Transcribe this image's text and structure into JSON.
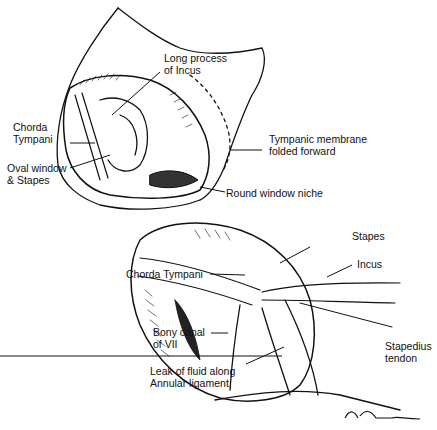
{
  "figure": {
    "top_view": {
      "labels": {
        "long_process_incus": [
          "Long process",
          "of Incus"
        ],
        "chorda_tympani": [
          "Chorda",
          "Tympani"
        ],
        "oval_window": [
          "Oval window",
          "& Stapes"
        ],
        "tympanic_membrane": [
          "Tympanic membrane",
          "folded forward"
        ],
        "round_window": [
          "Round window niche"
        ]
      }
    },
    "bottom_view": {
      "labels": {
        "stapes": [
          "Stapes"
        ],
        "incus": [
          "Incus"
        ],
        "chorda_tympani": [
          "Chorda Tympani"
        ],
        "bony_canal": [
          "Bony canal",
          "of VII"
        ],
        "leak": [
          "Leak of fluid along",
          "Annular ligament"
        ],
        "stapedius": [
          "Stapedius",
          "tendon"
        ]
      }
    },
    "signature": "M. Miller"
  }
}
